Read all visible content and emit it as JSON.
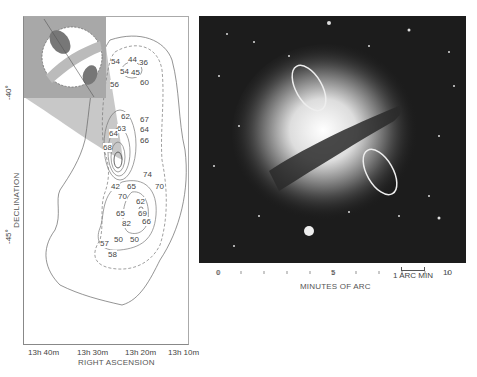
{
  "contour_map": {
    "y_axis": {
      "label": "DECLINATION",
      "ticks": [
        "-40°",
        "-45°"
      ]
    },
    "x_axis": {
      "label": "RIGHT ASCENSION",
      "ticks": [
        "13h 40m",
        "13h 30m",
        "13h 20m",
        "13h 10m"
      ]
    },
    "contour_labels": [
      {
        "text": "54",
        "x": 111,
        "y": 62
      },
      {
        "text": "44",
        "x": 128,
        "y": 60
      },
      {
        "text": "36",
        "x": 139,
        "y": 63
      },
      {
        "text": "54",
        "x": 120,
        "y": 72
      },
      {
        "text": "45",
        "x": 131,
        "y": 73
      },
      {
        "text": "56",
        "x": 110,
        "y": 85
      },
      {
        "text": "60",
        "x": 140,
        "y": 83
      },
      {
        "text": "62",
        "x": 121,
        "y": 117
      },
      {
        "text": "67",
        "x": 140,
        "y": 120
      },
      {
        "text": "63",
        "x": 117,
        "y": 129
      },
      {
        "text": "64",
        "x": 109,
        "y": 134
      },
      {
        "text": "64",
        "x": 140,
        "y": 130
      },
      {
        "text": "66",
        "x": 140,
        "y": 141
      },
      {
        "text": "68",
        "x": 103,
        "y": 148
      },
      {
        "text": "74",
        "x": 143,
        "y": 175
      },
      {
        "text": "42",
        "x": 111,
        "y": 187
      },
      {
        "text": "65",
        "x": 127,
        "y": 187
      },
      {
        "text": "70",
        "x": 155,
        "y": 187
      },
      {
        "text": "70",
        "x": 118,
        "y": 197
      },
      {
        "text": "62",
        "x": 136,
        "y": 202
      },
      {
        "text": "65",
        "x": 116,
        "y": 214
      },
      {
        "text": "69",
        "x": 138,
        "y": 214
      },
      {
        "text": "82",
        "x": 122,
        "y": 224
      },
      {
        "text": "66",
        "x": 142,
        "y": 222
      },
      {
        "text": "57",
        "x": 100,
        "y": 244
      },
      {
        "text": "50",
        "x": 114,
        "y": 240
      },
      {
        "text": "50",
        "x": 130,
        "y": 240
      },
      {
        "text": "58",
        "x": 108,
        "y": 255
      }
    ]
  },
  "photo": {
    "x_axis": {
      "label": "MINUTES OF ARC",
      "ticks": [
        "0",
        "5",
        "10"
      ]
    },
    "scale_bar_label": "1 ARC MIN"
  }
}
